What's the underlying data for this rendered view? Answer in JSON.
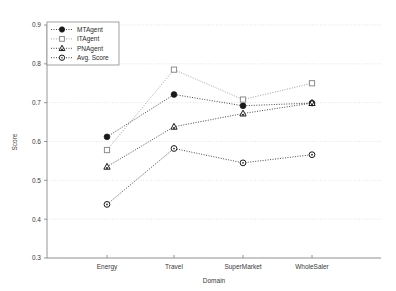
{
  "chart_data": {
    "type": "line",
    "title": "",
    "xlabel": "Domain",
    "ylabel": "Score",
    "categories": [
      "Energy",
      "Travel",
      "SuperMarket",
      "WholeSaler"
    ],
    "ylim": [
      0.3,
      0.9
    ],
    "yticks": [
      "0.3",
      "0.4",
      "0.5",
      "0.6",
      "0.7",
      "0.8",
      "0.9"
    ],
    "ytick_values": [
      0.3,
      0.4,
      0.5,
      0.6,
      0.7,
      0.8,
      0.9
    ],
    "grid": true,
    "legend_position": "upper left",
    "series": [
      {
        "name": "MTAgent",
        "marker": "filled-circle",
        "color": "#1a1a1a",
        "values": [
          0.612,
          0.721,
          0.692,
          0.699
        ]
      },
      {
        "name": "ITAgent",
        "marker": "open-square",
        "color": "#8c8c8c",
        "values": [
          0.578,
          0.785,
          0.708,
          0.75
        ]
      },
      {
        "name": "PNAgent",
        "marker": "open-triangle",
        "color": "#1a1a1a",
        "values": [
          0.535,
          0.638,
          0.672,
          0.699
        ]
      },
      {
        "name": "Avg. Score",
        "marker": "open-circle",
        "color": "#1a1a1a",
        "values": [
          0.438,
          0.582,
          0.545,
          0.566
        ]
      }
    ]
  },
  "axes": {
    "y_axis_title": "Score",
    "x_axis_title": "Domain"
  },
  "legend": {
    "items": [
      {
        "label": "MTAgent"
      },
      {
        "label": "ITAgent"
      },
      {
        "label": "PNAgent"
      },
      {
        "label": "Avg. Score"
      }
    ]
  }
}
